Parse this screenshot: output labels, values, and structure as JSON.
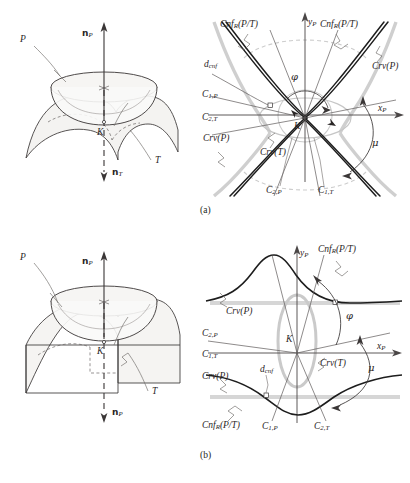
{
  "figure": {
    "title_caption_a": "(a)",
    "title_caption_b": "(b)",
    "colors": {
      "ink": "#2a2626",
      "dark_curve": "#1a1a1a",
      "light_curve": "#c9c9c9",
      "mid_gray": "#8f8f8f",
      "surface_fill": "#f4f3f1",
      "leader": "#6e6a68"
    }
  },
  "panel_a_3d": {
    "name": "saddle-and-bowl-surfaces",
    "labels": {
      "normal_p": {
        "symbol": "n",
        "sub": "P",
        "text": "nP"
      },
      "normal_t": {
        "symbol": "n",
        "sub": "T",
        "text": "nT"
      },
      "surface_p": "P",
      "surface_t": "T",
      "contact_point": "K"
    }
  },
  "panel_a_plot": {
    "name": "conformal-indicatrix-plot-a",
    "axes": {
      "x_label": "x",
      "x_sub": "P",
      "y_label": "y",
      "y_sub": "P"
    },
    "labels": [
      {
        "id": "cnf-left",
        "text": "Cnf",
        "sub": "R",
        "tail": "(P/T)"
      },
      {
        "id": "cnf-right",
        "text": "Cnf",
        "sub": "R",
        "tail": "(P/T)"
      },
      {
        "id": "crv-p-right",
        "text": "Crv",
        "sub": "",
        "tail": "(P)"
      },
      {
        "id": "crv-p-left",
        "text": "Crv",
        "sub": "",
        "tail": "(P)"
      },
      {
        "id": "crv-t",
        "text": "Crv",
        "sub": "",
        "tail": "(T)"
      },
      {
        "id": "d-cnf",
        "text": "d",
        "sub": "cnf",
        "tail": ""
      },
      {
        "id": "c1p",
        "text": "C",
        "sub": "1,P",
        "tail": ""
      },
      {
        "id": "c2t",
        "text": "C",
        "sub": "2,T",
        "tail": ""
      },
      {
        "id": "c2p",
        "text": "C",
        "sub": "2,P",
        "tail": ""
      },
      {
        "id": "c1t",
        "text": "C",
        "sub": "1,T",
        "tail": ""
      },
      {
        "id": "phi",
        "text": "φ",
        "sub": "",
        "tail": ""
      },
      {
        "id": "mu",
        "text": "μ",
        "sub": "",
        "tail": ""
      },
      {
        "id": "origin",
        "text": "K",
        "sub": "",
        "tail": ""
      }
    ]
  },
  "panel_b_3d": {
    "name": "bowl-and-dome-surfaces",
    "labels": {
      "normal_p_up": {
        "symbol": "n",
        "sub": "P",
        "text": "nP"
      },
      "normal_p_down": {
        "symbol": "n",
        "sub": "P",
        "text": "nP"
      },
      "surface_p": "P",
      "surface_t": "T",
      "contact_point": "K"
    }
  },
  "panel_b_plot": {
    "name": "conformal-indicatrix-plot-b",
    "axes": {
      "x_label": "x",
      "x_sub": "P",
      "y_label": "y",
      "y_sub": "P"
    },
    "labels": [
      {
        "id": "cnf-top-right",
        "text": "Cnf",
        "sub": "R",
        "tail": "(P/T)"
      },
      {
        "id": "cnf-bottom-left",
        "text": "Cnf",
        "sub": "R",
        "tail": "(P/T)"
      },
      {
        "id": "crv-p-upper",
        "text": "Crv",
        "sub": "",
        "tail": "(P)"
      },
      {
        "id": "crv-p-lower",
        "text": "Crv",
        "sub": "",
        "tail": "(P)"
      },
      {
        "id": "crv-t",
        "text": "Crv",
        "sub": "",
        "tail": "(T)"
      },
      {
        "id": "d-cnf",
        "text": "d",
        "sub": "cnf",
        "tail": ""
      },
      {
        "id": "c2p",
        "text": "C",
        "sub": "2,P",
        "tail": ""
      },
      {
        "id": "c1t",
        "text": "C",
        "sub": "1,T",
        "tail": ""
      },
      {
        "id": "c1p",
        "text": "C",
        "sub": "1,P",
        "tail": ""
      },
      {
        "id": "c2t",
        "text": "C",
        "sub": "2,T",
        "tail": ""
      },
      {
        "id": "phi",
        "text": "φ",
        "sub": "",
        "tail": ""
      },
      {
        "id": "mu",
        "text": "μ",
        "sub": "",
        "tail": ""
      },
      {
        "id": "origin",
        "text": "K",
        "sub": "",
        "tail": ""
      }
    ]
  }
}
